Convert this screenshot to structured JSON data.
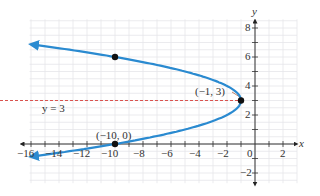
{
  "chart_data": {
    "type": "line",
    "title": "",
    "xlabel": "x",
    "ylabel": "y",
    "xlim": [
      -16,
      3
    ],
    "ylim": [
      -2.6,
      8.6
    ],
    "grid": true,
    "x_ticks": [
      -16,
      -14,
      -12,
      -10,
      -8,
      -6,
      -4,
      -2,
      0,
      2
    ],
    "y_ticks": [
      -2,
      2,
      4,
      6,
      8
    ],
    "x_tick_labels": [
      "−16",
      "−14",
      "−12",
      "−10",
      "−8",
      "−6",
      "−4",
      "−2",
      "0",
      "2"
    ],
    "y_tick_labels": [
      "−2",
      "2",
      "4",
      "6",
      "8"
    ],
    "series": [
      {
        "name": "x = -(y - 3)^2 - 1",
        "kind": "parabola-opening-left",
        "color": "#2a8ad0",
        "vertex": [
          -1,
          3
        ],
        "points": [
          [
            -15.4,
            6.8
          ],
          [
            -10,
            6
          ],
          [
            -5,
            5
          ],
          [
            -2,
            4
          ],
          [
            -1,
            3
          ],
          [
            -2,
            2
          ],
          [
            -5,
            1
          ],
          [
            -10,
            0
          ],
          [
            -15.4,
            -0.8
          ]
        ],
        "arrows": "both-ends"
      }
    ],
    "marked_points": [
      {
        "x": -10,
        "y": 6,
        "label": ""
      },
      {
        "x": -1,
        "y": 3,
        "label": "(−1, 3)"
      },
      {
        "x": -10,
        "y": 0,
        "label": "(−10, 0)"
      }
    ],
    "axis_of_symmetry": {
      "equation": "y = 3",
      "style": "dashed",
      "color": "#d9534f"
    },
    "annotations": [
      "(−1, 3)",
      "(−10, 0)",
      "y = 3"
    ]
  },
  "labels": {
    "x_axis": "x",
    "y_axis": "y",
    "vertex": "(−1, 3)",
    "x_intercept": "(−10, 0)",
    "symmetry": "y = 3",
    "zero": "0"
  },
  "ticks": {
    "x": [
      "−16",
      "−14",
      "−12",
      "−10",
      "−8",
      "−6",
      "−4",
      "−2",
      "2"
    ],
    "y": [
      "8",
      "6",
      "4",
      "2",
      "−2"
    ]
  }
}
